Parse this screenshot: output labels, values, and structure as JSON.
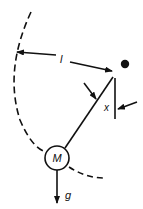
{
  "diagram": {
    "type": "pendulum",
    "labels": {
      "length": "l",
      "displacement": "x",
      "mass": "M",
      "gravity": "g"
    },
    "colors": {
      "stroke": "#111111",
      "background": "#ffffff"
    }
  }
}
